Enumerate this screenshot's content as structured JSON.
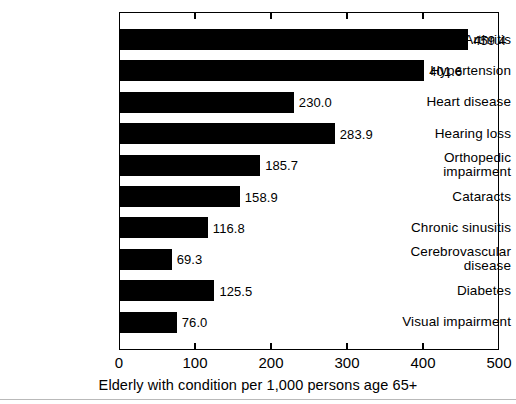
{
  "chart_data": {
    "type": "bar",
    "orientation": "horizontal",
    "title": "",
    "xlabel": "Elderly with condition per 1,000 persons age 65+",
    "ylabel": "",
    "xlim": [
      0,
      500
    ],
    "xticks": [
      "0",
      "100",
      "200",
      "300",
      "400",
      "500"
    ],
    "xtick_values": [
      0,
      100,
      200,
      300,
      400,
      500
    ],
    "grid": false,
    "legend": null,
    "bar_color": "#000000",
    "categories": [
      "Arthritis",
      "Hypertension",
      "Heart disease",
      "Hearing loss",
      "Orthopedic\nimpairment",
      "Cataracts",
      "Chronic sinusitis",
      "Cerebrovascular\ndisease",
      "Diabetes",
      "Visual impairment"
    ],
    "values": [
      459.4,
      401.6,
      230.0,
      283.9,
      185.7,
      158.9,
      116.8,
      69.3,
      125.5,
      76.0
    ],
    "value_labels": [
      "459.4",
      "401.6",
      "230.0",
      "283.9",
      "185.7",
      "158.9",
      "116.8",
      "69.3",
      "125.5",
      "76.0"
    ]
  }
}
